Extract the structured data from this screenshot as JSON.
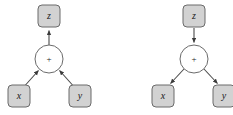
{
  "figure": {
    "canvas": {
      "width": 233,
      "height": 115,
      "background_color": "#ffffff"
    },
    "style": {
      "box_fill_color": "#d2d2d2",
      "box_stroke_color": "#6b6b6b",
      "circle_fill_color": "#ffffff",
      "circle_stroke_color": "#6b6b6b",
      "edge_color": "#4a4a4a",
      "label_color": "#1a1a1a"
    },
    "diagrams": [
      {
        "id": "forward-graph",
        "name": "forward-propagation-graph",
        "direction": "upward",
        "nodes": {
          "output": {
            "label": "z",
            "shape": "rounded-box",
            "cx": 49,
            "cy": 16
          },
          "operation": {
            "label": "+",
            "shape": "circle",
            "cx": 49,
            "cy": 59
          },
          "input_left": {
            "label": "x",
            "shape": "rounded-box",
            "cx": 19,
            "cy": 96
          },
          "input_right": {
            "label": "y",
            "shape": "rounded-box",
            "cx": 80,
            "cy": 96
          }
        },
        "edges": [
          {
            "from": "operation",
            "to": "output",
            "arrow_at": "output"
          },
          {
            "from": "input_left",
            "to": "operation",
            "arrow_at": "operation"
          },
          {
            "from": "input_right",
            "to": "operation",
            "arrow_at": "operation"
          }
        ]
      },
      {
        "id": "backward-graph",
        "name": "backward-propagation-graph",
        "direction": "downward",
        "nodes": {
          "output": {
            "label": "z",
            "shape": "rounded-box",
            "cx": 194,
            "cy": 16
          },
          "operation": {
            "label": "+",
            "shape": "circle",
            "cx": 194,
            "cy": 59
          },
          "input_left": {
            "label": "x",
            "shape": "rounded-box",
            "cx": 163,
            "cy": 96
          },
          "input_right": {
            "label": "y",
            "shape": "rounded-box",
            "cx": 224,
            "cy": 96
          }
        },
        "edges": [
          {
            "from": "output",
            "to": "operation",
            "arrow_at": "operation"
          },
          {
            "from": "operation",
            "to": "input_left",
            "arrow_at": "input_left"
          },
          {
            "from": "operation",
            "to": "input_right",
            "arrow_at": "input_right"
          }
        ]
      }
    ]
  }
}
